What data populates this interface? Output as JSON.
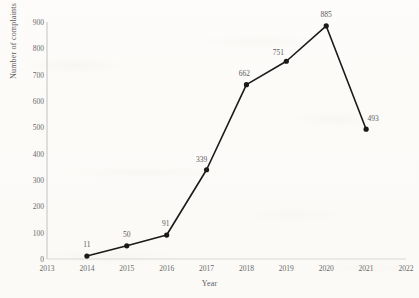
{
  "chart_data": {
    "type": "line",
    "title": "",
    "xlabel": "Year",
    "ylabel": "Number of complaints",
    "x": [
      2014,
      2015,
      2016,
      2017,
      2018,
      2019,
      2020,
      2021
    ],
    "values": [
      11,
      50,
      91,
      339,
      662,
      751,
      885,
      493
    ],
    "point_labels": [
      "11",
      "50",
      "91",
      "339",
      "662",
      "751",
      "885",
      "493"
    ],
    "xlim": [
      2013,
      2022
    ],
    "ylim": [
      0,
      900
    ],
    "xticks": [
      "2013",
      "2014",
      "2015",
      "2016",
      "2017",
      "2018",
      "2019",
      "2020",
      "2021",
      "2022"
    ],
    "yticks": [
      "0",
      "100",
      "200",
      "300",
      "400",
      "500",
      "600",
      "700",
      "800",
      "900"
    ],
    "grid": false,
    "legend": null,
    "series_color": "#1a1a1a",
    "marker": "circle",
    "label_color": "#5a5a5a",
    "axis_color": "#b7b7b7"
  }
}
